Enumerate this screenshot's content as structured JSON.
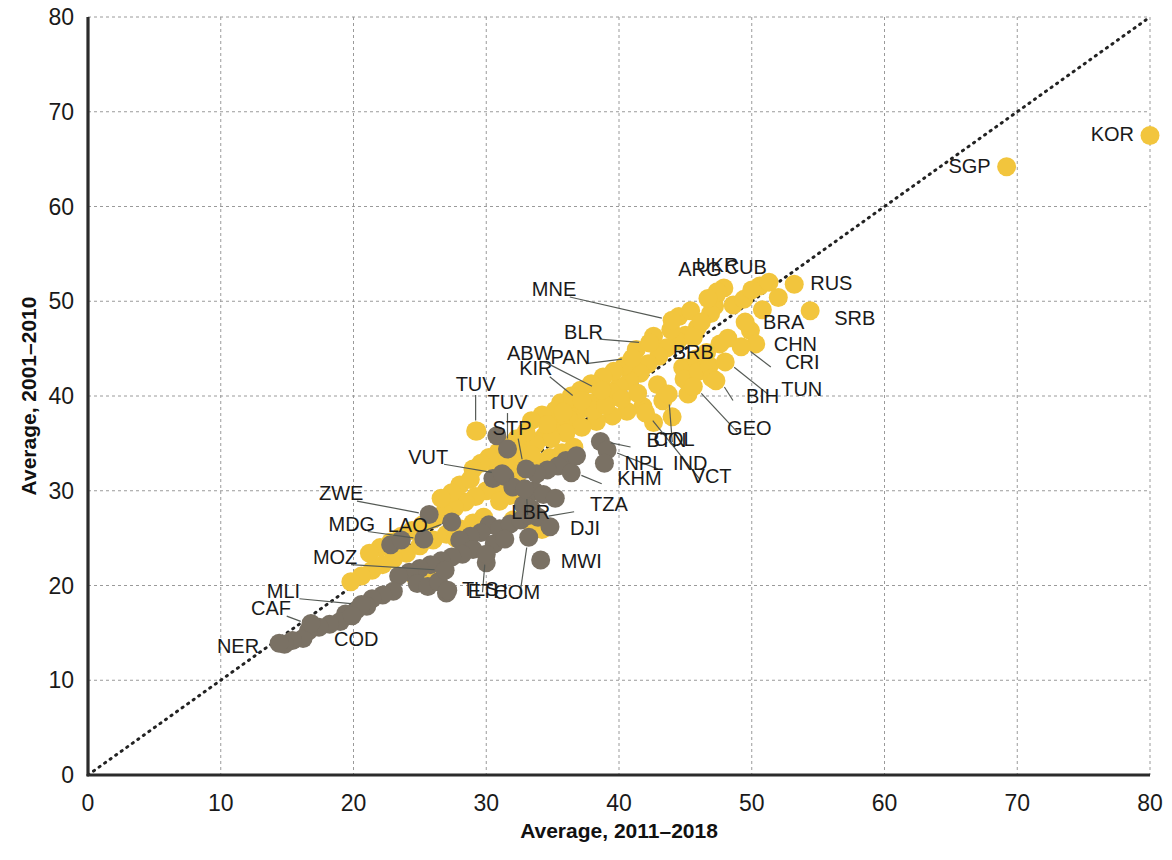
{
  "chart_data": {
    "type": "scatter",
    "title": "",
    "xlabel": "Average, 2011–2018",
    "ylabel": "Average, 2001–2010",
    "xlim": [
      0,
      80
    ],
    "ylim": [
      0,
      80
    ],
    "xticks": [
      0,
      10,
      20,
      30,
      40,
      50,
      60,
      70,
      80
    ],
    "yticks": [
      0,
      10,
      20,
      30,
      40,
      50,
      60,
      70,
      80
    ],
    "xtick_labels": [
      "0",
      "10",
      "20",
      "30",
      "40",
      "50",
      "60",
      "70",
      "80"
    ],
    "ytick_labels": [
      "0",
      "10",
      "20",
      "30",
      "40",
      "50",
      "60",
      "70",
      "80"
    ],
    "grid": true,
    "legend": "none",
    "annotations": [
      {
        "text": "45-degree reference line",
        "type": "identity-line",
        "from": [
          0,
          0
        ],
        "to": [
          80,
          80
        ],
        "style": "dotted"
      }
    ],
    "series": [
      {
        "name": "group-yellow",
        "color": "#F2C53D",
        "points": [
          {
            "label": "KOR",
            "x": 80.0,
            "y": 67.5,
            "label_pos": "left"
          },
          {
            "label": "SGP",
            "x": 69.2,
            "y": 64.2,
            "label_pos": "left"
          },
          {
            "label": "RUS",
            "x": 53.2,
            "y": 51.8,
            "label_pos": "right"
          },
          {
            "label": "SRB",
            "x": 54.4,
            "y": 49.0,
            "label_pos": "right"
          },
          {
            "label": "CUB",
            "x": 50.0,
            "y": 51.2,
            "label_pos": "above"
          },
          {
            "label": "UKR",
            "x": 47.4,
            "y": 51.0,
            "label_pos": "above"
          },
          {
            "label": "ARG",
            "x": 46.7,
            "y": 50.3,
            "label_pos": "above"
          },
          {
            "label": "MNE",
            "x": 44.0,
            "y": 48.0,
            "label_pos": "leader-left"
          },
          {
            "label": "BRA",
            "x": 49.5,
            "y": 47.8,
            "label_pos": "right"
          },
          {
            "label": "CHN",
            "x": 50.3,
            "y": 45.5,
            "label_pos": "right"
          },
          {
            "label": "CRI",
            "x": 49.2,
            "y": 45.2,
            "label_pos": "leader-right"
          },
          {
            "label": "TUN",
            "x": 48.0,
            "y": 43.6,
            "label_pos": "leader-right"
          },
          {
            "label": "BIH",
            "x": 47.3,
            "y": 41.6,
            "label_pos": "leader-right"
          },
          {
            "label": "BRB",
            "x": 45.6,
            "y": 46.2,
            "label_pos": "below"
          },
          {
            "label": "BLR",
            "x": 42.3,
            "y": 45.6,
            "label_pos": "leader-left"
          },
          {
            "label": "PAN",
            "x": 41.0,
            "y": 44.0,
            "label_pos": "leader-left"
          },
          {
            "label": "GEO",
            "x": 45.6,
            "y": 41.0,
            "label_pos": "leader-right"
          },
          {
            "label": "COL",
            "x": 43.7,
            "y": 40.2,
            "label_pos": "leader-right"
          },
          {
            "label": "VCT",
            "x": 42.0,
            "y": 38.2,
            "label_pos": "leader-right"
          },
          {
            "label": "KIR",
            "x": 37.2,
            "y": 39.5,
            "label_pos": "leader-left"
          },
          {
            "label": "ABW",
            "x": 38.7,
            "y": 40.6,
            "label_pos": "leader-left"
          },
          {
            "label": "TUV",
            "x": 29.2,
            "y": 36.3,
            "label_pos": "above"
          }
        ]
      },
      {
        "name": "group-dark",
        "color": "#7A7164",
        "points": [
          {
            "label": "TUV",
            "x": 31.6,
            "y": 34.4,
            "label_pos": "leader-above"
          },
          {
            "label": "STP",
            "x": 33.0,
            "y": 32.3,
            "label_pos": "leader-above"
          },
          {
            "label": "VUT",
            "x": 31.2,
            "y": 31.8,
            "label_pos": "leader-left"
          },
          {
            "label": "BTN",
            "x": 38.6,
            "y": 35.2,
            "label_pos": "leader-right"
          },
          {
            "label": "IND",
            "x": 39.1,
            "y": 34.3,
            "label_pos": "right"
          },
          {
            "label": "NPL",
            "x": 38.9,
            "y": 32.9,
            "label_pos": "right"
          },
          {
            "label": "KHM",
            "x": 36.4,
            "y": 31.9,
            "label_pos": "leader-right"
          },
          {
            "label": "LBR",
            "x": 32.9,
            "y": 30.2,
            "label_pos": "leader-below"
          },
          {
            "label": "TZA",
            "x": 33.9,
            "y": 27.2,
            "label_pos": "leader-right"
          },
          {
            "label": "DJI",
            "x": 34.8,
            "y": 26.2,
            "label_pos": "right"
          },
          {
            "label": "MWI",
            "x": 34.1,
            "y": 22.7,
            "label_pos": "right"
          },
          {
            "label": "COM",
            "x": 33.2,
            "y": 25.1,
            "label_pos": "leader-below"
          },
          {
            "label": "LAO",
            "x": 27.4,
            "y": 26.7,
            "label_pos": "leader-left"
          },
          {
            "label": "ZWE",
            "x": 25.7,
            "y": 27.5,
            "label_pos": "leader-left"
          },
          {
            "label": "TLS",
            "x": 30.0,
            "y": 23.3,
            "label_pos": "leader-below"
          },
          {
            "label": "MDG",
            "x": 25.3,
            "y": 24.9,
            "label_pos": "leader-left"
          },
          {
            "label": "MOZ",
            "x": 26.9,
            "y": 21.6,
            "label_pos": "leader-left"
          },
          {
            "label": "ETH",
            "x": 27.1,
            "y": 19.5,
            "label_pos": "right"
          },
          {
            "label": "MLI",
            "x": 20.6,
            "y": 18.0,
            "label_pos": "leader-left"
          },
          {
            "label": "CAF",
            "x": 16.8,
            "y": 16.0,
            "label_pos": "leader-left"
          },
          {
            "label": "COD",
            "x": 19.9,
            "y": 16.8,
            "label_pos": "below"
          },
          {
            "label": "NER",
            "x": 14.4,
            "y": 13.9,
            "label_pos": "left"
          }
        ]
      }
    ],
    "unlabeled_yellow": [
      [
        47.9,
        51.4
      ],
      [
        47.3,
        50.6
      ],
      [
        47.2,
        49.5
      ],
      [
        46.9,
        48.7
      ],
      [
        48.6,
        49.6
      ],
      [
        49.4,
        50.2
      ],
      [
        50.6,
        51.6
      ],
      [
        51.3,
        52.0
      ],
      [
        45.9,
        47.2
      ],
      [
        45.0,
        46.4
      ],
      [
        44.4,
        45.8
      ],
      [
        43.6,
        45.1
      ],
      [
        43.0,
        44.2
      ],
      [
        42.2,
        43.4
      ],
      [
        44.8,
        43.0
      ],
      [
        45.8,
        43.9
      ],
      [
        46.6,
        44.6
      ],
      [
        47.6,
        45.5
      ],
      [
        41.6,
        42.4
      ],
      [
        40.8,
        41.6
      ],
      [
        40.0,
        41.0
      ],
      [
        39.4,
        40.4
      ],
      [
        38.6,
        39.9
      ],
      [
        38.0,
        39.3
      ],
      [
        37.4,
        38.7
      ],
      [
        36.8,
        38.1
      ],
      [
        36.2,
        37.6
      ],
      [
        35.6,
        37.0
      ],
      [
        35.0,
        36.4
      ],
      [
        34.4,
        35.8
      ],
      [
        33.8,
        35.2
      ],
      [
        33.2,
        34.6
      ],
      [
        32.6,
        34.0
      ],
      [
        32.0,
        33.4
      ],
      [
        31.4,
        32.8
      ],
      [
        30.8,
        32.2
      ],
      [
        41.3,
        44.9
      ],
      [
        42.6,
        46.3
      ],
      [
        43.9,
        47.0
      ],
      [
        40.4,
        43.2
      ],
      [
        39.6,
        42.6
      ],
      [
        38.8,
        42.0
      ],
      [
        37.9,
        41.3
      ],
      [
        37.1,
        40.6
      ],
      [
        36.4,
        40.0
      ],
      [
        42.9,
        41.2
      ],
      [
        43.3,
        39.5
      ],
      [
        41.8,
        38.9
      ],
      [
        40.6,
        38.4
      ],
      [
        39.5,
        37.9
      ],
      [
        38.3,
        37.3
      ],
      [
        37.2,
        36.7
      ],
      [
        36.0,
        36.1
      ],
      [
        34.9,
        35.5
      ],
      [
        33.7,
        34.9
      ],
      [
        44.9,
        41.8
      ],
      [
        46.0,
        42.6
      ],
      [
        46.8,
        43.2
      ],
      [
        35.6,
        39.3
      ],
      [
        36.5,
        39.8
      ],
      [
        37.3,
        39.1
      ],
      [
        35.2,
        38.5
      ],
      [
        34.2,
        38.0
      ],
      [
        33.4,
        37.4
      ],
      [
        34.6,
        37.0
      ],
      [
        35.8,
        38.3
      ],
      [
        38.1,
        38.5
      ],
      [
        39.0,
        39.0
      ],
      [
        40.2,
        39.7
      ],
      [
        41.4,
        40.3
      ],
      [
        33.0,
        36.2
      ],
      [
        32.3,
        35.5
      ],
      [
        31.7,
        34.8
      ],
      [
        30.9,
        34.1
      ],
      [
        30.2,
        33.5
      ],
      [
        29.6,
        32.9
      ],
      [
        29.0,
        32.3
      ],
      [
        34.0,
        33.0
      ],
      [
        34.8,
        33.5
      ],
      [
        35.7,
        34.0
      ],
      [
        36.6,
        34.6
      ],
      [
        33.2,
        32.4
      ],
      [
        32.4,
        31.8
      ],
      [
        31.6,
        31.2
      ],
      [
        30.8,
        30.6
      ],
      [
        30.0,
        30.0
      ],
      [
        29.2,
        29.4
      ],
      [
        28.4,
        28.8
      ],
      [
        27.6,
        28.2
      ],
      [
        26.8,
        27.6
      ],
      [
        26.0,
        27.0
      ],
      [
        25.2,
        26.4
      ],
      [
        28.0,
        30.6
      ],
      [
        28.8,
        31.2
      ],
      [
        27.4,
        29.8
      ],
      [
        26.6,
        29.2
      ],
      [
        31.0,
        28.9
      ],
      [
        31.8,
        29.5
      ],
      [
        32.6,
        30.1
      ],
      [
        24.4,
        25.8
      ],
      [
        23.6,
        25.2
      ],
      [
        22.8,
        24.6
      ],
      [
        22.0,
        24.0
      ],
      [
        21.2,
        23.4
      ],
      [
        24.0,
        23.4
      ],
      [
        25.0,
        24.2
      ],
      [
        26.0,
        24.8
      ],
      [
        27.0,
        25.4
      ],
      [
        28.0,
        26.0
      ],
      [
        29.0,
        26.6
      ],
      [
        29.8,
        27.2
      ],
      [
        23.0,
        22.8
      ],
      [
        22.2,
        22.2
      ],
      [
        21.4,
        21.6
      ],
      [
        20.6,
        21.0
      ],
      [
        19.8,
        20.4
      ],
      [
        24.6,
        21.0
      ],
      [
        25.4,
        21.6
      ],
      [
        26.2,
        20.6
      ],
      [
        33.4,
        33.8
      ],
      [
        29.3,
        36.3
      ],
      [
        27.7,
        25.0
      ],
      [
        28.6,
        24.6
      ],
      [
        33.5,
        26.3
      ],
      [
        34.2,
        25.9
      ],
      [
        32.0,
        26.9
      ],
      [
        49.9,
        46.9
      ],
      [
        48.2,
        46.1
      ],
      [
        47.0,
        41.9
      ],
      [
        45.2,
        40.2
      ],
      [
        44.0,
        37.8
      ],
      [
        42.6,
        37.2
      ],
      [
        50.8,
        49.1
      ],
      [
        52.0,
        50.4
      ],
      [
        44.5,
        48.4
      ],
      [
        45.4,
        49.0
      ],
      [
        46.2,
        47.8
      ]
    ],
    "unlabeled_dark": [
      [
        31.4,
        31.5
      ],
      [
        30.5,
        31.3
      ],
      [
        32.0,
        30.4
      ],
      [
        33.6,
        30.0
      ],
      [
        34.3,
        29.6
      ],
      [
        35.2,
        29.2
      ],
      [
        30.2,
        26.4
      ],
      [
        31.0,
        26.0
      ],
      [
        31.8,
        26.5
      ],
      [
        32.6,
        26.9
      ],
      [
        33.2,
        27.4
      ],
      [
        29.6,
        25.6
      ],
      [
        28.8,
        25.2
      ],
      [
        28.0,
        24.8
      ],
      [
        30.6,
        24.4
      ],
      [
        31.4,
        24.9
      ],
      [
        29.0,
        23.8
      ],
      [
        28.2,
        23.3
      ],
      [
        27.4,
        23.0
      ],
      [
        26.6,
        22.6
      ],
      [
        25.8,
        22.2
      ],
      [
        25.0,
        21.8
      ],
      [
        24.2,
        21.4
      ],
      [
        23.4,
        21.0
      ],
      [
        24.8,
        20.2
      ],
      [
        25.6,
        19.9
      ],
      [
        26.4,
        20.4
      ],
      [
        23.0,
        19.4
      ],
      [
        22.2,
        19.0
      ],
      [
        21.4,
        18.6
      ],
      [
        21.0,
        17.8
      ],
      [
        20.2,
        17.4
      ],
      [
        19.4,
        17.0
      ],
      [
        19.0,
        16.2
      ],
      [
        18.2,
        15.9
      ],
      [
        17.4,
        15.6
      ],
      [
        16.6,
        15.2
      ],
      [
        16.2,
        14.4
      ],
      [
        15.4,
        14.2
      ],
      [
        14.8,
        13.8
      ],
      [
        36.0,
        33.2
      ],
      [
        36.8,
        33.7
      ],
      [
        35.4,
        32.6
      ],
      [
        34.6,
        32.2
      ],
      [
        33.8,
        31.8
      ],
      [
        32.8,
        28.5
      ],
      [
        33.4,
        28.1
      ],
      [
        30.0,
        22.4
      ],
      [
        27.0,
        19.2
      ],
      [
        22.8,
        24.3
      ],
      [
        23.6,
        24.8
      ],
      [
        30.8,
        35.8
      ]
    ]
  }
}
